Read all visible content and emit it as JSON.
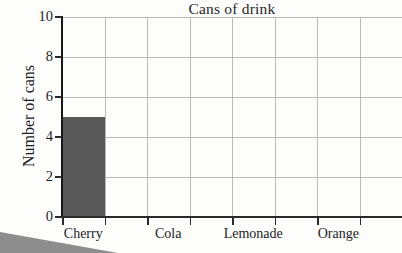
{
  "chart_data": {
    "type": "bar",
    "title": "Cans of drink",
    "xlabel": "",
    "ylabel": "Number of cans",
    "categories": [
      "Cherry",
      "Cola",
      "Lemonade",
      "Orange"
    ],
    "values": [
      5,
      0,
      0,
      0
    ],
    "ylim": [
      0,
      10
    ],
    "ytick_labels": [
      "0",
      "2",
      "4",
      "6",
      "8",
      "10"
    ],
    "ytick_values": [
      0,
      2,
      4,
      6,
      8,
      10
    ],
    "grid": true,
    "legend": "none",
    "bar_color": "#595959",
    "grid_color": "#b9b9b9",
    "axis_color": "#2a2a2d",
    "background_color": "#fdfdfc"
  },
  "artifacts": {
    "scan_shadow_label": "scan-shadow-wedge"
  }
}
